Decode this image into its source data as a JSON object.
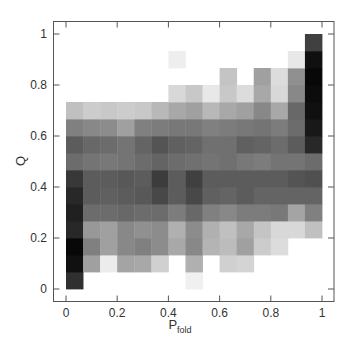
{
  "chart_data": {
    "type": "heatmap",
    "title": "",
    "xlabel": "P",
    "xlabel_subscript": "fold",
    "ylabel": "Q",
    "xlim": [
      0,
      1
    ],
    "ylim": [
      0,
      1
    ],
    "xticks": [
      "0",
      "0.2",
      "0.4",
      "0.6",
      "0.8",
      "1"
    ],
    "yticks": [
      "0",
      "0.2",
      "0.4",
      "0.6",
      "0.8",
      "1"
    ],
    "grid": false,
    "legend": null,
    "colormap": "grayscale (darker = higher density)",
    "n_cols": 15,
    "n_rows": 15,
    "x_bins": "15 equal bins of P_fold from 0 to 1",
    "y_bins": "15 equal bins of Q from 0 to 1",
    "rows_bottom_to_top_gray_hex": [
      [
        "#303030",
        "#ffffff",
        "#ffffff",
        "#ffffff",
        "#ffffff",
        "#ffffff",
        "#ffffff",
        "#f0f0f0",
        "#ffffff",
        "#ffffff",
        "#ffffff",
        "#ffffff",
        "#ffffff",
        "#ffffff",
        "#ffffff"
      ],
      [
        "#101010",
        "#a0a0a0",
        "#ececec",
        "#a4a4a4",
        "#a8a8a8",
        "#d0d0d0",
        "#ffffff",
        "#b0b0b0",
        "#ffffff",
        "#d0d0d0",
        "#d4d4d4",
        "#ffffff",
        "#ffffff",
        "#ffffff",
        "#ffffff"
      ],
      [
        "#080808",
        "#808080",
        "#a0a0a0",
        "#888888",
        "#808080",
        "#8c8c8c",
        "#a8a8a8",
        "#888888",
        "#b4b4b4",
        "#bcbcbc",
        "#a0a0a0",
        "#cccccc",
        "#dcdcdc",
        "#ffffff",
        "#ffffff"
      ],
      [
        "#282828",
        "#989898",
        "#a0a0a0",
        "#888888",
        "#909090",
        "#8c8c8c",
        "#b0b0b0",
        "#8c8c8c",
        "#b0b0b0",
        "#c0c0c0",
        "#a8a8a8",
        "#c4c4c4",
        "#d8d8d8",
        "#d8d8d8",
        "#c0c0c0"
      ],
      [
        "#202020",
        "#6c6c6c",
        "#6c6c6c",
        "#686868",
        "#6c6c6c",
        "#6c6c6c",
        "#7c7c7c",
        "#686868",
        "#808080",
        "#888888",
        "#7c7c7c",
        "#7c7c7c",
        "#787878",
        "#a4a4a4",
        "#808080"
      ],
      [
        "#282828",
        "#5c5c5c",
        "#606060",
        "#5c5c5c",
        "#585858",
        "#484848",
        "#5c5c5c",
        "#484848",
        "#606060",
        "#646464",
        "#5c5c5c",
        "#646464",
        "#646464",
        "#646464",
        "#646464"
      ],
      [
        "#383838",
        "#5c5c5c",
        "#5c5c5c",
        "#585858",
        "#5c5c5c",
        "#3c3c3c",
        "#5c5c5c",
        "#404040",
        "#5c5c5c",
        "#5c5c5c",
        "#5c5c5c",
        "#5c5c5c",
        "#5c5c5c",
        "#545454",
        "#505050"
      ],
      [
        "#6c6c6c",
        "#747474",
        "#787878",
        "#747474",
        "#6c6c6c",
        "#646464",
        "#6c6c6c",
        "#707070",
        "#747474",
        "#707070",
        "#787878",
        "#7c7c7c",
        "#747474",
        "#747474",
        "#6c6c6c"
      ],
      [
        "#5c5c5c",
        "#686868",
        "#6c6c6c",
        "#747474",
        "#646464",
        "#545454",
        "#606060",
        "#646464",
        "#707070",
        "#707070",
        "#606060",
        "#646464",
        "#6c6c6c",
        "#5c5c5c",
        "#282828"
      ],
      [
        "#808080",
        "#888888",
        "#8c8c8c",
        "#a0a0a0",
        "#808080",
        "#7c7c7c",
        "#787878",
        "#787878",
        "#808080",
        "#7c7c7c",
        "#787878",
        "#747474",
        "#7c7c7c",
        "#6c6c6c",
        "#181818"
      ],
      [
        "#c0c0c0",
        "#cccccc",
        "#c8c8c8",
        "#cccccc",
        "#c8c8c8",
        "#b8b8b8",
        "#a8a8a8",
        "#a0a0a0",
        "#b8b8b8",
        "#a8a8a8",
        "#a0a0a0",
        "#888888",
        "#a8a8a8",
        "#686868",
        "#101010"
      ],
      [
        "#ffffff",
        "#ffffff",
        "#ffffff",
        "#ffffff",
        "#ffffff",
        "#ffffff",
        "#d8d8d8",
        "#c8c8c8",
        "#e8e8e8",
        "#c8c8c8",
        "#dcdcdc",
        "#a8a8a8",
        "#d8d8d8",
        "#888888",
        "#0c0c0c"
      ],
      [
        "#ffffff",
        "#ffffff",
        "#ffffff",
        "#ffffff",
        "#ffffff",
        "#ffffff",
        "#ffffff",
        "#ffffff",
        "#ffffff",
        "#c4c4c4",
        "#ffffff",
        "#a0a0a0",
        "#dcdcdc",
        "#909090",
        "#080808"
      ],
      [
        "#ffffff",
        "#ffffff",
        "#ffffff",
        "#ffffff",
        "#ffffff",
        "#ffffff",
        "#eeeeee",
        "#ffffff",
        "#ffffff",
        "#ffffff",
        "#ffffff",
        "#ffffff",
        "#ffffff",
        "#e8e8e8",
        "#101010"
      ],
      [
        "#ffffff",
        "#ffffff",
        "#ffffff",
        "#ffffff",
        "#ffffff",
        "#ffffff",
        "#ffffff",
        "#ffffff",
        "#ffffff",
        "#ffffff",
        "#ffffff",
        "#ffffff",
        "#ffffff",
        "#ffffff",
        "#404040"
      ]
    ]
  },
  "axes": {
    "x_label_main": "P",
    "x_label_sub": "fold",
    "y_label": "Q",
    "x_tick_labels": [
      "0",
      "0.2",
      "0.4",
      "0.6",
      "0.8",
      "1"
    ],
    "y_tick_labels": [
      "0",
      "0.2",
      "0.4",
      "0.6",
      "0.8",
      "1"
    ]
  },
  "colors": {
    "frame": "#555555",
    "text": "#333333",
    "background": "#ffffff"
  }
}
